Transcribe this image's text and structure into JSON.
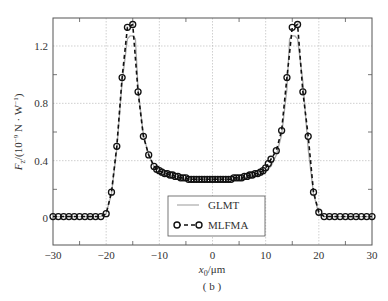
{
  "chart_data": {
    "type": "line",
    "title": "",
    "subtitle": "(b)",
    "xlabel": "x0/μm",
    "ylabel": "Fz/(10^-9 N · W^-1)",
    "xlim": [
      -30,
      30
    ],
    "ylim": [
      -0.15,
      1.4
    ],
    "xticks": [
      -30,
      -20,
      -10,
      0,
      10,
      20,
      30
    ],
    "yticks": [
      0,
      0.4,
      0.8,
      1.2
    ],
    "grid": true,
    "legend_position": "lower center",
    "series": [
      {
        "name": "GLMT",
        "style": "solid gray line",
        "x": [
          -30,
          -21,
          -20,
          -19,
          -18,
          -17,
          -16,
          -15.5,
          -15,
          -14.5,
          -14,
          -13,
          -12,
          -11,
          -10,
          -9,
          -8,
          -7,
          -6,
          -5,
          -4,
          -3,
          -2,
          -1,
          0,
          1,
          2,
          3,
          4,
          5,
          6,
          7,
          8,
          9,
          10,
          11,
          12,
          13,
          14,
          14.5,
          15,
          15.5,
          16,
          17,
          18,
          19,
          20,
          21,
          30
        ],
        "values": [
          0.01,
          0.01,
          0.03,
          0.17,
          0.48,
          0.95,
          1.25,
          1.27,
          1.27,
          1.25,
          0.9,
          0.58,
          0.44,
          0.36,
          0.33,
          0.31,
          0.3,
          0.29,
          0.28,
          0.27,
          0.27,
          0.27,
          0.27,
          0.27,
          0.27,
          0.27,
          0.27,
          0.27,
          0.27,
          0.27,
          0.28,
          0.29,
          0.3,
          0.31,
          0.33,
          0.36,
          0.44,
          0.58,
          0.9,
          1.25,
          1.27,
          1.27,
          1.25,
          0.95,
          0.48,
          0.17,
          0.03,
          0.01,
          0.01
        ]
      },
      {
        "name": "MLFMA",
        "style": "dashed black line with open circle markers",
        "x": [
          -30,
          -29,
          -28,
          -27,
          -26,
          -25,
          -24,
          -23,
          -22,
          -21,
          -20,
          -19,
          -18,
          -17,
          -16,
          -15,
          -14,
          -13,
          -12,
          -11,
          -10.5,
          -10,
          -9.5,
          -9,
          -8.5,
          -8,
          -7.5,
          -7,
          -6.5,
          -6,
          -5.5,
          -5,
          -4.5,
          -4,
          -3.5,
          -3,
          -2.5,
          -2,
          -1.5,
          -1,
          -0.5,
          0,
          0.5,
          1,
          1.5,
          2,
          2.5,
          3,
          3.5,
          4,
          4.5,
          5,
          5.5,
          6,
          6.5,
          7,
          7.5,
          8,
          8.5,
          9,
          9.5,
          10,
          10.5,
          11,
          12,
          13,
          14,
          15,
          16,
          17,
          18,
          19,
          20,
          21,
          22,
          23,
          24,
          25,
          26,
          27,
          28,
          29,
          30
        ],
        "values": [
          0.01,
          0.01,
          0.01,
          0.01,
          0.01,
          0.01,
          0.01,
          0.01,
          0.01,
          0.01,
          0.03,
          0.18,
          0.5,
          0.98,
          1.33,
          1.35,
          0.88,
          0.57,
          0.44,
          0.36,
          0.34,
          0.33,
          0.32,
          0.31,
          0.31,
          0.3,
          0.3,
          0.29,
          0.29,
          0.28,
          0.28,
          0.28,
          0.27,
          0.27,
          0.27,
          0.27,
          0.27,
          0.27,
          0.27,
          0.27,
          0.27,
          0.27,
          0.27,
          0.27,
          0.27,
          0.27,
          0.27,
          0.27,
          0.27,
          0.28,
          0.28,
          0.28,
          0.28,
          0.29,
          0.29,
          0.3,
          0.3,
          0.31,
          0.31,
          0.32,
          0.33,
          0.35,
          0.38,
          0.41,
          0.47,
          0.61,
          0.98,
          1.33,
          1.35,
          0.88,
          0.57,
          0.18,
          0.04,
          0.01,
          0.01,
          0.01,
          0.01,
          0.01,
          0.01,
          0.01,
          0.01,
          0.01,
          0.01
        ]
      }
    ]
  },
  "labels": {
    "y_axis_label_main": "F",
    "y_axis_label_sub": "z",
    "y_axis_label_rest": "/(10",
    "y_axis_label_exp": "−9",
    "y_axis_label_unit": " N · W",
    "y_axis_label_exp2": "−1",
    "y_axis_label_close": ")",
    "x_axis_label_main": "x",
    "x_axis_label_sub": "0",
    "x_axis_label_unit": "/μm",
    "caption": "( b )",
    "legend_glmt": "GLMT",
    "legend_mlfma": "MLFMA",
    "xtick_labels": [
      "−30",
      "−20",
      "−10",
      "0",
      "10",
      "20",
      "30"
    ],
    "ytick_labels": [
      "0",
      "0.4",
      "0.8",
      "1.2"
    ]
  }
}
